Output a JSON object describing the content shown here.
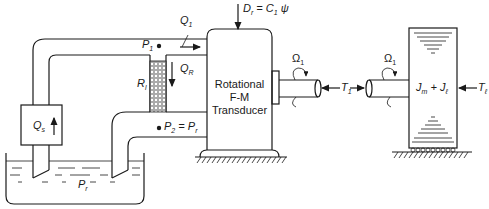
{
  "figure": {
    "transducer": {
      "line1": "Rotational",
      "line2": "F-M",
      "line3": "Transducer",
      "parameter_label": "D",
      "parameter_sub": "r",
      "parameter_eq": " = C",
      "parameter_eq_sub": "1",
      "parameter_psi": " ψ"
    },
    "pump": {
      "label": "Q",
      "sub": "s"
    },
    "flow_1": {
      "label": "Q",
      "sub": "1"
    },
    "flow_R": {
      "label": "Q",
      "sub": "R"
    },
    "resistor": {
      "label": "R",
      "sub": "l"
    },
    "pressure_1": {
      "label": "P",
      "sub": "1"
    },
    "pressure_2": {
      "label": "P",
      "sub": "2",
      "eq": " = P",
      "eq_sub": "r"
    },
    "reservoir": {
      "label": "P",
      "sub": "r"
    },
    "omega_left": {
      "label": "Ω",
      "sub": "1"
    },
    "omega_right": {
      "label": "Ω",
      "sub": "1"
    },
    "torque_left": {
      "label": "T",
      "sub": "1"
    },
    "torque_right": {
      "label": "T",
      "sub": "1"
    },
    "load": {
      "label_a": "J",
      "sub_a": "m",
      "plus": " + J",
      "sub_b": "ℓ"
    },
    "load_torque": {
      "label": "T",
      "sub": "ℓ"
    }
  }
}
